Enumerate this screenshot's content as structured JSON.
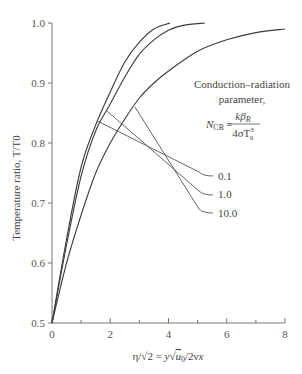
{
  "chart_data": {
    "type": "line",
    "title": "",
    "xlabel": "η/√2 = y√(u0/2νx)",
    "ylabel": "Temperature ratio, T/T0",
    "xlim": [
      0,
      8
    ],
    "ylim": [
      0.5,
      1.0
    ],
    "x_ticks": [
      0,
      2,
      4,
      6,
      8
    ],
    "y_ticks": [
      0.5,
      0.6,
      0.7,
      0.8,
      0.9,
      1.0
    ],
    "x_tick_labels": [
      "0",
      "2",
      "4",
      "6",
      "8"
    ],
    "y_tick_labels": [
      "0.5",
      "0.6",
      "0.7",
      "0.8",
      "0.9",
      "1.0"
    ],
    "grid": false,
    "legend_position": "inline annotations (right)",
    "annotation": {
      "line1": "Conduction–radiation",
      "line2": "parameter,",
      "formula_lhs": "N",
      "formula_lhs_sub": "CR",
      "formula_eq": "=",
      "numerator": "kβ",
      "numerator_sub": "R",
      "denominator": "4σT",
      "denominator_sub": "0",
      "denominator_sup": "3"
    },
    "series": [
      {
        "name": "0.1",
        "x": [
          0,
          0.5,
          1.0,
          1.5,
          2.0,
          2.5,
          3.0,
          3.5,
          4.05
        ],
        "y": [
          0.5,
          0.64,
          0.76,
          0.83,
          0.885,
          0.935,
          0.968,
          0.99,
          1.0
        ]
      },
      {
        "name": "1.0",
        "x": [
          0,
          0.5,
          1.0,
          1.5,
          2.0,
          2.5,
          3.0,
          3.5,
          4.0,
          4.5,
          5.25
        ],
        "y": [
          0.5,
          0.63,
          0.745,
          0.82,
          0.865,
          0.91,
          0.948,
          0.972,
          0.988,
          0.996,
          1.0
        ]
      },
      {
        "name": "10.0",
        "x": [
          0,
          0.5,
          1.0,
          1.5,
          2.0,
          2.5,
          3.0,
          3.5,
          4.0,
          5.0,
          6.0,
          7.0,
          8.0
        ],
        "y": [
          0.5,
          0.6,
          0.68,
          0.75,
          0.8,
          0.84,
          0.875,
          0.9,
          0.92,
          0.953,
          0.972,
          0.984,
          0.99
        ]
      }
    ],
    "leaders": [
      {
        "label": "0.1",
        "from": [
          1.55,
          0.837
        ],
        "to_px": [
          213,
          176
        ]
      },
      {
        "label": "1.0",
        "from": [
          1.85,
          0.855
        ],
        "to_px": [
          213,
          195
        ]
      },
      {
        "label": "10.0",
        "from": [
          2.85,
          0.86
        ],
        "to_px": [
          213,
          213
        ]
      }
    ]
  },
  "labels": {
    "n01": "0.1",
    "n10": "1.0",
    "n100": "10.0"
  }
}
